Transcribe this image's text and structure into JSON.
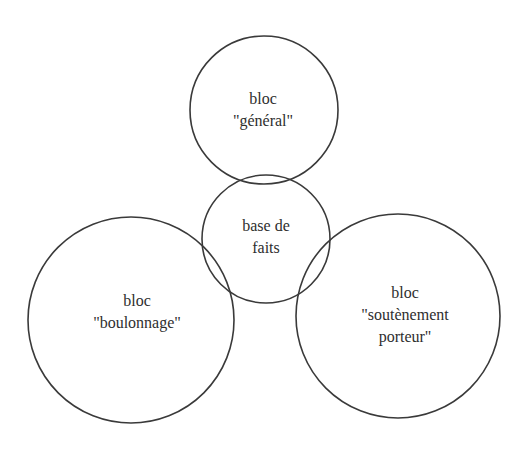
{
  "diagram": {
    "stroke_color": "#3a3a3a",
    "nodes": [
      {
        "id": "general",
        "lines": [
          "bloc",
          "\"général\""
        ],
        "cx": 264,
        "cy": 110,
        "r": 74,
        "label_x": 263,
        "label_y": 110
      },
      {
        "id": "base",
        "lines": [
          "base de",
          "faits"
        ],
        "cx": 266,
        "cy": 239,
        "r": 64,
        "label_x": 266,
        "label_y": 237
      },
      {
        "id": "boulonnage",
        "lines": [
          "bloc",
          "\"boulonnage\""
        ],
        "cx": 131,
        "cy": 320,
        "r": 103,
        "label_x": 137,
        "label_y": 312
      },
      {
        "id": "soutenement",
        "lines": [
          "bloc",
          "\"soutènement",
          "porteur\""
        ],
        "cx": 398,
        "cy": 316,
        "r": 102,
        "label_x": 405,
        "label_y": 315
      }
    ]
  }
}
